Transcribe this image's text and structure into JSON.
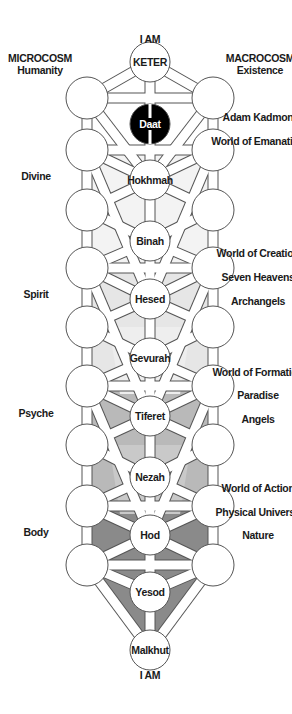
{
  "top_label": "I AM",
  "bottom_label": "I AM",
  "left_header": {
    "title": "MICROCOSM",
    "subtitle": "Humanity"
  },
  "right_header": {
    "title": "MACROCOSM",
    "subtitle": "Existence"
  },
  "left_labels": [
    {
      "text": "Divine",
      "y": 176
    },
    {
      "text": "Spirit",
      "y": 294
    },
    {
      "text": "Psyche",
      "y": 413
    },
    {
      "text": "Body",
      "y": 532
    }
  ],
  "right_labels": [
    {
      "text": "Adam Kadmon",
      "y": 117
    },
    {
      "text": "World of Emanation",
      "y": 141
    },
    {
      "text": "World of Creation",
      "y": 253
    },
    {
      "text": "Seven Heavens",
      "y": 277
    },
    {
      "text": "Archangels",
      "y": 301
    },
    {
      "text": "World of Formation",
      "y": 372
    },
    {
      "text": "Paradise",
      "y": 395
    },
    {
      "text": "Angels",
      "y": 419
    },
    {
      "text": "World of Action",
      "y": 488
    },
    {
      "text": "Physical Universe",
      "y": 512
    },
    {
      "text": "Nature",
      "y": 535
    }
  ],
  "sephirot": [
    {
      "name": "KETER",
      "y": 62
    },
    {
      "name": "Daat",
      "y": 124,
      "dark": true
    },
    {
      "name": "Hokhmah",
      "y": 180
    },
    {
      "name": "Binah",
      "y": 241
    },
    {
      "name": "Hesed",
      "y": 299
    },
    {
      "name": "Gevurah",
      "y": 358
    },
    {
      "name": "Tiferet",
      "y": 416
    },
    {
      "name": "Nezah",
      "y": 477
    },
    {
      "name": "Hod",
      "y": 535
    },
    {
      "name": "Yesod",
      "y": 592
    },
    {
      "name": "Malkhut",
      "y": 650
    }
  ],
  "side_circle_rows": [
    98,
    150,
    210,
    268,
    327,
    386,
    445,
    506,
    565
  ],
  "colors": {
    "line": "#555555",
    "light": "#e6e6e6",
    "medium": "#b9b9b9",
    "dark": "#8a8a8a",
    "daat": "#000000"
  }
}
